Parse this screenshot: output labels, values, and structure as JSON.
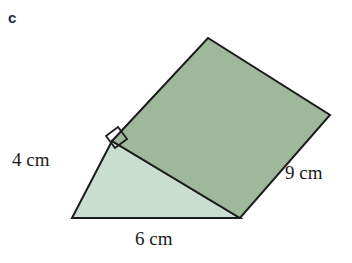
{
  "figure": {
    "part_label": "c",
    "shape_name": "triangular-prism",
    "labels": {
      "left_edge": "4 cm",
      "right_edge": "9 cm",
      "base_edge": "6 cm"
    },
    "colors": {
      "top_face_fill": "#9fb89c",
      "front_face_fill": "#c9ded0",
      "outline": "#1c1c1c",
      "background": "#ffffff",
      "part_label_color": "#27304a",
      "text_color": "#1b1b1b"
    },
    "geometry": {
      "top_face_points": "112,141 208,38 330,115 240,218",
      "front_face_points": "112,141 240,218 72,218",
      "right_angle_marker_points": "106,136 118,127 127,139 115,148",
      "vertices": {
        "apex_back": [
          208,
          38
        ],
        "right": [
          330,
          115
        ],
        "bottom_right": [
          240,
          218
        ],
        "corner_right_angle": [
          112,
          141
        ],
        "bottom_left": [
          72,
          218
        ]
      }
    }
  }
}
